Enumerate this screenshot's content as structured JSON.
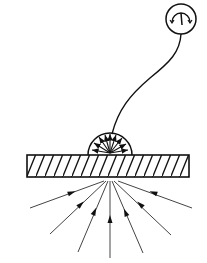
{
  "diagram": {
    "colors": {
      "background": "#ffffff",
      "stroke": "#111111",
      "ray": "#555555"
    },
    "meter": {
      "icon": "gauge-icon",
      "cx": 181,
      "cy": 19,
      "r": 15
    },
    "wire": {
      "path": "M112 140 C125 100, 145 85, 165 70 C178 60, 181 45, 181 34"
    },
    "slab": {
      "x": 27,
      "y": 155,
      "width": 162,
      "height": 22,
      "hatch": "diagonal"
    },
    "detector": {
      "icon": "semicircle-detector-icon",
      "cx": 110,
      "cy": 155,
      "r": 22,
      "inner_arrows": 9
    },
    "rays": [
      {
        "x1": 30,
        "y1": 208,
        "x2": 104,
        "y2": 181
      },
      {
        "x1": 50,
        "y1": 234,
        "x2": 106,
        "y2": 181
      },
      {
        "x1": 78,
        "y1": 252,
        "x2": 108,
        "y2": 181
      },
      {
        "x1": 110,
        "y1": 258,
        "x2": 110,
        "y2": 181
      },
      {
        "x1": 143,
        "y1": 253,
        "x2": 112,
        "y2": 181
      },
      {
        "x1": 171,
        "y1": 235,
        "x2": 114,
        "y2": 181
      },
      {
        "x1": 192,
        "y1": 208,
        "x2": 118,
        "y2": 181
      }
    ]
  }
}
